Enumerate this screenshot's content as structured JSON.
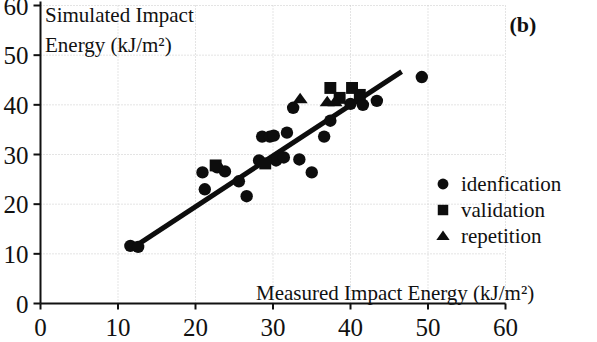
{
  "chart_data": {
    "type": "scatter",
    "title": "",
    "panel_label": "(b)",
    "xlabel": "Measured Impact Energy (kJ/m²)",
    "ylabel_line1": "Simulated Impact",
    "ylabel_line2": "Energy (kJ/m²)",
    "xlim": [
      0,
      60
    ],
    "ylim": [
      0,
      60
    ],
    "xticks": [
      0,
      10,
      20,
      30,
      40,
      50,
      60
    ],
    "yticks": [
      0,
      10,
      20,
      30,
      40,
      50,
      60
    ],
    "xtick_labels": [
      "0",
      "10",
      "20",
      "30",
      "40",
      "50",
      "60"
    ],
    "ytick_labels": [
      "0",
      "10",
      "20",
      "30",
      "40",
      "50",
      "60"
    ],
    "grid": true,
    "grid_style": "dotted",
    "legend_position": "lower-right-inside",
    "marker_color": "#0d0d0d",
    "line_color": "#0d0d0d",
    "series": [
      {
        "name": "idenfication",
        "marker": "circle",
        "points": [
          [
            11.6,
            11.6
          ],
          [
            12.6,
            11.4
          ],
          [
            20.9,
            26.4
          ],
          [
            21.2,
            23.0
          ],
          [
            22.8,
            27.4
          ],
          [
            23.8,
            26.6
          ],
          [
            25.6,
            24.6
          ],
          [
            26.6,
            21.6
          ],
          [
            28.2,
            28.8
          ],
          [
            28.6,
            33.6
          ],
          [
            29.6,
            33.6
          ],
          [
            30.1,
            33.8
          ],
          [
            30.4,
            28.8
          ],
          [
            31.8,
            34.4
          ],
          [
            31.4,
            29.4
          ],
          [
            32.6,
            39.4
          ],
          [
            33.4,
            29.0
          ],
          [
            35.0,
            26.4
          ],
          [
            36.6,
            33.6
          ],
          [
            37.4,
            36.8
          ],
          [
            40.0,
            40.2
          ],
          [
            41.6,
            40.0
          ],
          [
            43.4,
            40.8
          ],
          [
            49.2,
            45.6
          ]
        ]
      },
      {
        "name": "validation",
        "marker": "square",
        "points": [
          [
            22.6,
            27.8
          ],
          [
            29.0,
            28.2
          ],
          [
            37.4,
            43.4
          ],
          [
            38.6,
            41.4
          ],
          [
            40.2,
            43.4
          ],
          [
            41.2,
            42.0
          ]
        ]
      },
      {
        "name": "repetition",
        "marker": "triangle",
        "points": [
          [
            33.5,
            41.2
          ],
          [
            37.0,
            40.6
          ],
          [
            38.0,
            40.6
          ]
        ]
      }
    ],
    "trendline": {
      "x": [
        11.9,
        46.6
      ],
      "y": [
        11.2,
        46.7
      ]
    }
  }
}
